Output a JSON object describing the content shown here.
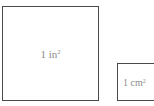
{
  "diagram": {
    "squares": [
      {
        "id": "big",
        "value": "1",
        "unit": "in",
        "exponent": "2"
      },
      {
        "id": "small",
        "value": "1",
        "unit": "cm",
        "exponent": "2"
      }
    ],
    "colors": {
      "border": "#4a4a4a",
      "label": "#8c8c8c",
      "background": "#ffffff"
    }
  }
}
